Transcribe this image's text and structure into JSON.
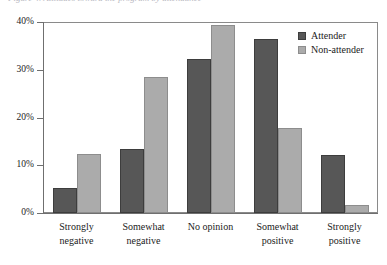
{
  "figure": {
    "clipped_caption": "Figure 4. Attitudes toward the program by attendance"
  },
  "legend": {
    "position": "top-right",
    "entries": [
      {
        "label": "Attender",
        "color": "#575757",
        "icon": "legend-swatch-icon"
      },
      {
        "label": "Non-attender",
        "color": "#ababab",
        "icon": "legend-swatch-icon"
      }
    ]
  },
  "axes": {
    "y_ticks": [
      "0%",
      "10%",
      "20%",
      "30%",
      "40%"
    ]
  },
  "chart_data": {
    "type": "bar",
    "title": "",
    "xlabel": "",
    "ylabel": "",
    "ylim": [
      0,
      40
    ],
    "ytick_values": [
      0,
      10,
      20,
      30,
      40
    ],
    "ytick_labels": [
      "0%",
      "10%",
      "20%",
      "30%",
      "40%"
    ],
    "grid": false,
    "legend_position": "top-right",
    "categories": [
      "Strongly\nnegative",
      "Somewhat\nnegative",
      "No opinion",
      "Somewhat\npositive",
      "Strongly\npositive"
    ],
    "series": [
      {
        "name": "Attender",
        "color": "#575757",
        "values": [
          5.3,
          13.5,
          32.2,
          36.5,
          12.1
        ]
      },
      {
        "name": "Non-attender",
        "color": "#ababab",
        "values": [
          12.4,
          28.5,
          39.4,
          17.8,
          1.7
        ]
      }
    ]
  }
}
